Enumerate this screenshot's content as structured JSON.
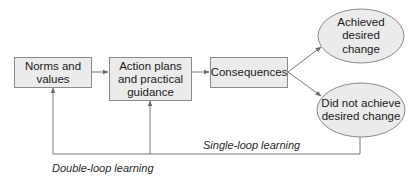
{
  "diagram": {
    "nodes": {
      "norms": {
        "label": "Norms and values",
        "shape": "rectangle"
      },
      "action": {
        "label": "Action plans and practical guidance",
        "shape": "rectangle"
      },
      "consequences": {
        "label": "Consequences",
        "shape": "rectangle"
      },
      "achieved": {
        "label": "Achieved desired change",
        "shape": "ellipse"
      },
      "not_achieved": {
        "label": "Did not achieve desired change",
        "shape": "ellipse"
      }
    },
    "edges": [
      {
        "from": "norms",
        "to": "action"
      },
      {
        "from": "action",
        "to": "consequences"
      },
      {
        "from": "consequences",
        "to": "achieved"
      },
      {
        "from": "consequences",
        "to": "not_achieved"
      },
      {
        "from": "not_achieved",
        "to": "action",
        "label": "Single-loop learning"
      },
      {
        "from": "not_achieved",
        "to": "norms",
        "label": "Double-loop learning"
      }
    ],
    "loops": {
      "single": "Single-loop learning",
      "double": "Double-loop learning"
    },
    "colors": {
      "node_fill": "#ebebeb",
      "node_border": "#8a8a8a",
      "line": "#7a7a7a"
    }
  }
}
